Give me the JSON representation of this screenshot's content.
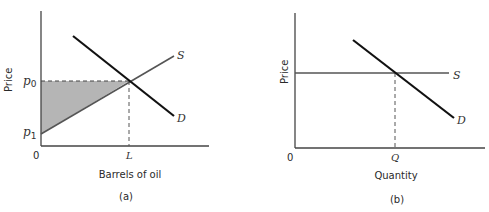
{
  "panels": [
    {
      "id": "a",
      "caption": "(a)",
      "xlabel": "Barrels of oil",
      "ylabel": "Price",
      "origin_label": "0",
      "x_tick_label": "L",
      "y_tick_labels": {
        "upper": "p",
        "upper_sub": "0",
        "lower": "p",
        "lower_sub": "1"
      },
      "supply_label": "S",
      "demand_label": "D",
      "shaded_region": "producer surplus triangle between p0, p1 and supply curve"
    },
    {
      "id": "b",
      "caption": "(b)",
      "xlabel": "Quantity",
      "ylabel": "Price",
      "origin_label": "0",
      "x_tick_label": "Q",
      "supply_label": "S",
      "demand_label": "D"
    }
  ],
  "colors": {
    "axis": "#444444",
    "supply": "#555555",
    "demand": "#111111",
    "shade": "#b5b5b5",
    "dashed": "#555555"
  }
}
